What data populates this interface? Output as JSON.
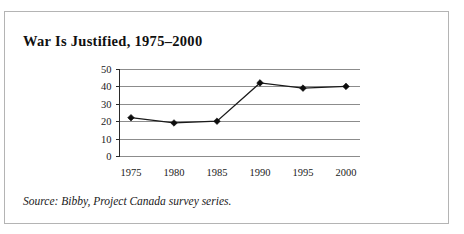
{
  "figure": {
    "title": "War Is Justified, 1975–2000",
    "source_note": "Source: Bibby, Project Canada survey series."
  },
  "colors": {
    "border": "#b4b4b4",
    "gridline": "#8c8c8c",
    "axis": "#2a2a2a",
    "line": "#1a1a1a",
    "marker": "#0d0d0d",
    "text": "#1a1a1a",
    "background": "#ffffff"
  },
  "chart_data": {
    "type": "line",
    "title": "War Is Justified, 1975–2000",
    "subtitle": "",
    "xlabel": "",
    "ylabel": "",
    "x": [
      1975,
      1980,
      1985,
      1990,
      1995,
      2000
    ],
    "categories": [
      "1975",
      "1980",
      "1985",
      "1990",
      "1995",
      "2000"
    ],
    "values": [
      22,
      19,
      20,
      42,
      39,
      40
    ],
    "series": [
      {
        "name": "War Is Justified",
        "values": [
          22,
          19,
          20,
          42,
          39,
          40
        ]
      }
    ],
    "ylim": [
      0,
      50
    ],
    "yticks": [
      0,
      10,
      20,
      30,
      40,
      50
    ],
    "ytick_labels": [
      "0",
      "10",
      "20",
      "30",
      "40",
      "50"
    ],
    "xticks": [
      1975,
      1980,
      1985,
      1990,
      1995,
      2000
    ],
    "xtick_labels": [
      "1975",
      "1980",
      "1985",
      "1990",
      "1995",
      "2000"
    ],
    "grid": true,
    "grid_axis": "y",
    "legend": false,
    "legend_position": "none",
    "marker": "diamond",
    "annotations": []
  }
}
